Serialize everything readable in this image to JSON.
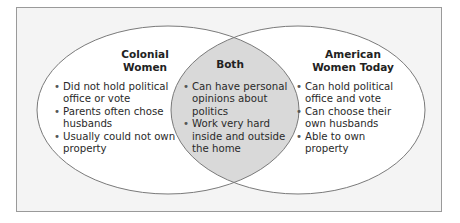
{
  "diagram": {
    "type": "venn",
    "colors": {
      "frame_border": "#9a9a9a",
      "frame_fill": "#f4f4f4",
      "circle_fill": "#ffffff",
      "overlap_fill": "#d9d9d9",
      "circle_stroke": "#7a7a7a"
    },
    "left": {
      "title_line1": "Colonial",
      "title_line2": "Women",
      "items": [
        "Did not hold political office or vote",
        "Parents often chose husbands",
        "Usually could not own property"
      ]
    },
    "center": {
      "title": "Both",
      "items": [
        "Can have personal opinions about politics",
        "Work very hard inside and outside the home"
      ]
    },
    "right": {
      "title_line1": "American",
      "title_line2": "Women Today",
      "items": [
        "Can hold political office and vote",
        "Can choose their own husbands",
        "Able to own property"
      ]
    }
  }
}
